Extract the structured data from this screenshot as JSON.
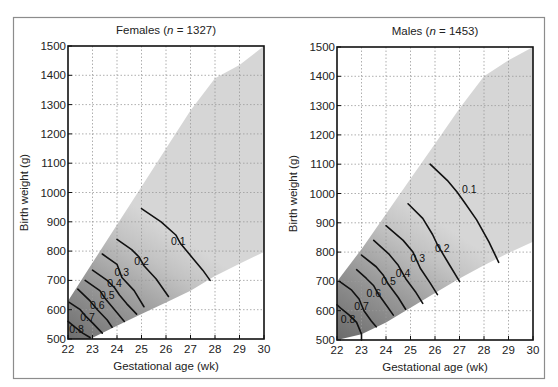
{
  "chart_data": [
    {
      "type": "line",
      "subtype": "contour",
      "title": "Females (n = 1327)",
      "title_parts": {
        "prefix": "Females (",
        "italic": "n",
        "suffix": " = 1327)"
      },
      "xlabel": "Gestational age (wk)",
      "ylabel": "Birth weight (g)",
      "xlim": [
        22,
        30
      ],
      "ylim": [
        500,
        1500
      ],
      "xticks": [
        22,
        23,
        24,
        25,
        26,
        27,
        28,
        29,
        30
      ],
      "yticks": [
        500,
        600,
        700,
        800,
        900,
        1000,
        1100,
        1200,
        1300,
        1400,
        1500
      ],
      "grid": true,
      "shaded_region": {
        "upper": [
          [
            22,
            630
          ],
          [
            23,
            760
          ],
          [
            24,
            890
          ],
          [
            25,
            1020
          ],
          [
            26,
            1150
          ],
          [
            27,
            1280
          ],
          [
            28,
            1390
          ],
          [
            29,
            1435
          ],
          [
            30,
            1500
          ]
        ],
        "lower": [
          [
            22.9,
            500
          ],
          [
            24,
            545
          ],
          [
            25,
            585
          ],
          [
            26,
            625
          ],
          [
            27,
            665
          ],
          [
            28,
            715
          ],
          [
            29,
            757
          ],
          [
            30,
            797
          ]
        ]
      },
      "contours": [
        {
          "level": 0.1,
          "label": "0.1",
          "label_at": [
            26.5,
            835
          ],
          "points": [
            [
              25,
              945
            ],
            [
              25.8,
              900
            ],
            [
              26.4,
              855
            ],
            [
              26.6,
              825
            ],
            [
              27.1,
              775
            ],
            [
              27.5,
              735
            ],
            [
              27.8,
              700
            ]
          ]
        },
        {
          "level": 0.2,
          "label": "0.2",
          "label_at": [
            25,
            765
          ],
          "points": [
            [
              24,
              840
            ],
            [
              24.6,
              805
            ],
            [
              24.9,
              780
            ],
            [
              25.1,
              750
            ],
            [
              25.6,
              705
            ],
            [
              26.1,
              645
            ]
          ]
        },
        {
          "level": 0.3,
          "label": "0.3",
          "label_at": [
            24.2,
            730
          ],
          "points": [
            [
              23.4,
              790
            ],
            [
              24,
              755
            ],
            [
              24.2,
              710
            ],
            [
              24.7,
              665
            ],
            [
              25.1,
              610
            ]
          ]
        },
        {
          "level": 0.4,
          "label": "0.4",
          "label_at": [
            23.9,
            690
          ],
          "points": [
            [
              23,
              735
            ],
            [
              23.6,
              700
            ],
            [
              23.9,
              675
            ],
            [
              24.1,
              650
            ],
            [
              24.4,
              620
            ],
            [
              24.8,
              585
            ]
          ]
        },
        {
          "level": 0.5,
          "label": "0.5",
          "label_at": [
            23.6,
            650
          ],
          "points": [
            [
              22.7,
              700
            ],
            [
              23.3,
              665
            ],
            [
              23.5,
              640
            ],
            [
              23.9,
              600
            ],
            [
              24.3,
              560
            ]
          ]
        },
        {
          "level": 0.6,
          "label": "0.6",
          "label_at": [
            23.2,
            615
          ],
          "points": [
            [
              22.4,
              670
            ],
            [
              22.9,
              630
            ],
            [
              23.2,
              600
            ],
            [
              23.6,
              565
            ],
            [
              23.8,
              540
            ]
          ]
        },
        {
          "level": 0.7,
          "label": "0.7",
          "label_at": [
            22.8,
            575
          ],
          "points": [
            [
              22.05,
              625
            ],
            [
              22.5,
              600
            ],
            [
              22.7,
              580
            ],
            [
              23.0,
              555
            ],
            [
              23.4,
              520
            ]
          ]
        },
        {
          "level": 0.8,
          "label": "0.8",
          "label_at": [
            22.35,
            535
          ],
          "points": [
            [
              22.0,
              560
            ],
            [
              22.3,
              540
            ],
            [
              22.6,
              520
            ],
            [
              22.9,
              505
            ]
          ]
        }
      ]
    },
    {
      "type": "line",
      "subtype": "contour",
      "title": "Males (n = 1453)",
      "title_parts": {
        "prefix": "Males (",
        "italic": "n",
        "suffix": " = 1453)"
      },
      "xlabel": "Gestational age (wk)",
      "ylabel": "Birth weight (g)",
      "xlim": [
        22,
        30
      ],
      "ylim": [
        500,
        1500
      ],
      "xticks": [
        22,
        23,
        24,
        25,
        26,
        27,
        28,
        29,
        30
      ],
      "yticks": [
        500,
        600,
        700,
        800,
        900,
        1000,
        1100,
        1200,
        1300,
        1400,
        1500
      ],
      "grid": true,
      "shaded_region": {
        "upper": [
          [
            22,
            700
          ],
          [
            23,
            810
          ],
          [
            24,
            930
          ],
          [
            25,
            1050
          ],
          [
            26,
            1170
          ],
          [
            27,
            1290
          ],
          [
            28,
            1400
          ],
          [
            29,
            1455
          ],
          [
            30,
            1500
          ]
        ],
        "lower": [
          [
            22,
            500
          ],
          [
            23,
            520
          ],
          [
            24,
            560
          ],
          [
            25,
            610
          ],
          [
            26,
            660
          ],
          [
            27,
            710
          ],
          [
            28,
            755
          ],
          [
            29,
            797
          ],
          [
            30,
            835
          ]
        ]
      },
      "contours": [
        {
          "level": 0.1,
          "label": "0.1",
          "label_at": [
            27.4,
            1015
          ],
          "points": [
            [
              25.8,
              1100
            ],
            [
              26.5,
              1045
            ],
            [
              26.9,
              1005
            ],
            [
              27.2,
              970
            ],
            [
              27.7,
              910
            ],
            [
              28.2,
              835
            ],
            [
              28.6,
              765
            ]
          ]
        },
        {
          "level": 0.2,
          "label": "0.2",
          "label_at": [
            26.3,
            815
          ],
          "points": [
            [
              24.9,
              965
            ],
            [
              25.5,
              915
            ],
            [
              25.9,
              860
            ],
            [
              26.1,
              825
            ],
            [
              26.6,
              755
            ],
            [
              27.0,
              700
            ]
          ]
        },
        {
          "level": 0.3,
          "label": "0.3",
          "label_at": [
            25.3,
            780
          ],
          "points": [
            [
              24,
              890
            ],
            [
              24.7,
              840
            ],
            [
              25.1,
              800
            ],
            [
              25.4,
              745
            ],
            [
              25.8,
              695
            ],
            [
              26.1,
              655
            ]
          ]
        },
        {
          "level": 0.4,
          "label": "0.4",
          "label_at": [
            24.7,
            730
          ],
          "points": [
            [
              23.5,
              840
            ],
            [
              24.1,
              795
            ],
            [
              24.5,
              755
            ],
            [
              24.8,
              710
            ],
            [
              25.2,
              665
            ],
            [
              25.5,
              625
            ]
          ]
        },
        {
          "level": 0.5,
          "label": "0.5",
          "label_at": [
            24.1,
            700
          ],
          "points": [
            [
              23.0,
              790
            ],
            [
              23.6,
              750
            ],
            [
              23.9,
              720
            ],
            [
              24.1,
              690
            ],
            [
              24.5,
              645
            ],
            [
              24.8,
              605
            ]
          ]
        },
        {
          "level": 0.6,
          "label": "0.6",
          "label_at": [
            23.5,
            660
          ],
          "points": [
            [
              22.8,
              740
            ],
            [
              23.2,
              710
            ],
            [
              23.5,
              685
            ],
            [
              23.7,
              655
            ],
            [
              24.0,
              620
            ],
            [
              24.3,
              585
            ]
          ]
        },
        {
          "level": 0.7,
          "label": "0.7",
          "label_at": [
            23.0,
            615
          ],
          "points": [
            [
              22.1,
              700
            ],
            [
              22.6,
              670
            ],
            [
              22.9,
              640
            ],
            [
              23.1,
              600
            ],
            [
              23.4,
              565
            ],
            [
              23.6,
              545
            ]
          ]
        },
        {
          "level": 0.8,
          "label": "0.8",
          "label_at": [
            22.45,
            570
          ],
          "points": [
            [
              22.0,
              620
            ],
            [
              22.2,
              605
            ],
            [
              22.5,
              585
            ],
            [
              22.8,
              560
            ],
            [
              23.0,
              520
            ],
            [
              23.0,
              500
            ]
          ]
        }
      ]
    }
  ]
}
